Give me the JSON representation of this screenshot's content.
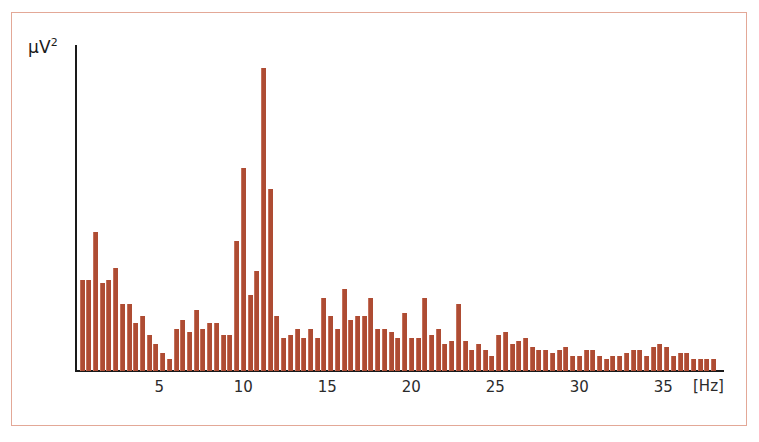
{
  "figure": {
    "background_color": "#ffffff",
    "frame_color": "#e3a897",
    "bar_color": "#ae4c33",
    "axis_color": "#1a1a1a"
  },
  "axes": {
    "y_label": "μV",
    "y_label_exponent": "2",
    "x_unit_label": "[Hz]",
    "x_tick_labels": [
      "5",
      "10",
      "15",
      "20",
      "25",
      "30",
      "35"
    ]
  },
  "chart_data": {
    "type": "bar",
    "title": "",
    "xlabel": "[Hz]",
    "ylabel": "μV²",
    "xlim": [
      0.4,
      38.4
    ],
    "ylim": [
      0,
      100
    ],
    "grid": false,
    "legend": null,
    "x_ticks": [
      5,
      10,
      15,
      20,
      25,
      30,
      35
    ],
    "bin_width_hz": 0.4,
    "x": [
      0.4,
      0.8,
      1.2,
      1.6,
      2.0,
      2.4,
      2.8,
      3.2,
      3.6,
      4.0,
      4.4,
      4.8,
      5.2,
      5.6,
      6.0,
      6.4,
      6.8,
      7.2,
      7.6,
      8.0,
      8.4,
      8.8,
      9.2,
      9.6,
      10.0,
      10.4,
      10.8,
      11.2,
      11.6,
      12.0,
      12.4,
      12.8,
      13.2,
      13.6,
      14.0,
      14.4,
      14.8,
      15.2,
      15.6,
      16.0,
      16.4,
      16.8,
      17.2,
      17.6,
      18.0,
      18.4,
      18.8,
      19.2,
      19.6,
      20.0,
      20.4,
      20.8,
      21.2,
      21.6,
      22.0,
      22.4,
      22.8,
      23.2,
      23.6,
      24.0,
      24.4,
      24.8,
      25.2,
      25.6,
      26.0,
      26.4,
      26.8,
      27.2,
      27.6,
      28.0,
      28.4,
      28.8,
      29.2,
      29.6,
      30.0,
      30.4,
      30.8,
      31.2,
      31.6,
      32.0,
      32.4,
      32.8,
      33.2,
      33.6,
      34.0,
      34.4,
      34.8,
      35.2,
      35.6,
      36.0,
      36.4,
      36.8,
      37.2,
      37.6,
      38.0
    ],
    "values": [
      30,
      30,
      46,
      29,
      30,
      34,
      22,
      22,
      16,
      18,
      12,
      9,
      6,
      4,
      14,
      17,
      13,
      20,
      14,
      16,
      16,
      12,
      12,
      43,
      67,
      25,
      33,
      100,
      60,
      18,
      11,
      12,
      14,
      11,
      14,
      11,
      24,
      18,
      14,
      27,
      17,
      18,
      18,
      24,
      14,
      14,
      13,
      11,
      19,
      11,
      11,
      24,
      12,
      14,
      9,
      10,
      22,
      10,
      7,
      9,
      7,
      5,
      12,
      13,
      9,
      10,
      11,
      8,
      7,
      7,
      6,
      7,
      8,
      5,
      5,
      7,
      7,
      5,
      4,
      5,
      5,
      6,
      7,
      7,
      5,
      8,
      9,
      8,
      5,
      6,
      6,
      4,
      4,
      4,
      4
    ]
  }
}
